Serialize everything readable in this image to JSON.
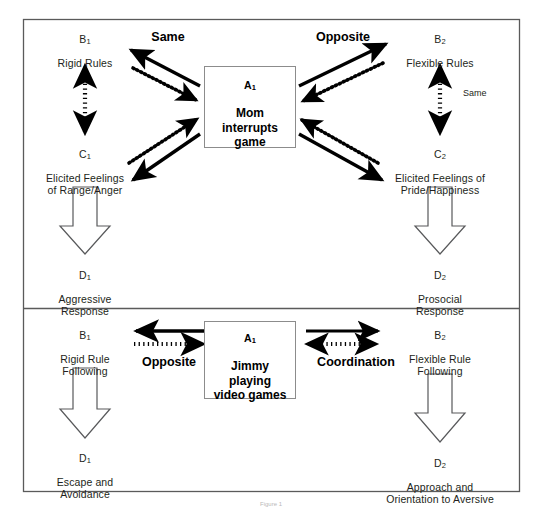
{
  "figure": {
    "caption": "Figure 1",
    "panels": [
      {
        "id": "panel-top",
        "center": {
          "code": "A1",
          "text": "Mom\ninterrupts\ngame"
        },
        "left": {
          "b": {
            "code": "B1",
            "text": "Rigid Rules"
          },
          "c": {
            "code": "C1",
            "text": "Elicited Feelings\nof Range/Anger"
          },
          "d": {
            "code": "D1",
            "text": "Aggressive\nResponse"
          },
          "relation_center": "Same",
          "relation_vertical": ""
        },
        "right": {
          "b": {
            "code": "B2",
            "text": "Flexible Rules"
          },
          "c": {
            "code": "C2",
            "text": "Elicited Feelings of\nPride/Happiness"
          },
          "d": {
            "code": "D2",
            "text": "Prosocial\nResponse"
          },
          "relation_center": "Opposite",
          "relation_vertical": "Same"
        }
      },
      {
        "id": "panel-bottom",
        "center": {
          "code": "A1",
          "text": "Jimmy\nplaying\nvideo games"
        },
        "left": {
          "b": {
            "code": "B1",
            "text": "Rigid  Rule\nFollowing"
          },
          "d": {
            "code": "D1",
            "text": "Escape and\nAvoidance"
          },
          "relation_center": "Opposite"
        },
        "right": {
          "b": {
            "code": "B2",
            "text": "Flexible Rule\nFollowing"
          },
          "d": {
            "code": "D2",
            "text": "Approach and\nOrientation to Aversive"
          },
          "relation_center": "Coordination"
        }
      }
    ],
    "colors": {
      "line": "#000000",
      "box_border": "#8c8c8c",
      "frame": "#5a5a5a",
      "text": "#231f20",
      "background": "#ffffff"
    }
  }
}
